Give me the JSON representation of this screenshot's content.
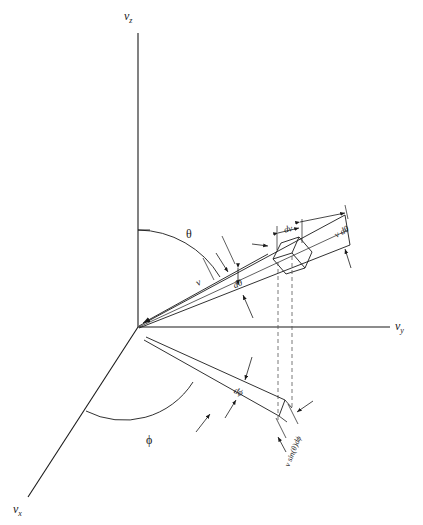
{
  "figure": {
    "axes": {
      "vz": {
        "label": "v",
        "sub": "z"
      },
      "vy": {
        "label": "v",
        "sub": "y"
      },
      "vx": {
        "label": "v",
        "sub": "x"
      }
    },
    "angles": {
      "theta": "θ",
      "phi": "ϕ"
    },
    "dimensions": {
      "speed": "v",
      "dv": "dv",
      "dtheta": "dθ",
      "v_dtheta": "v dθ",
      "dphi": "dϕ",
      "v_sin_theta_dphi": "v sin(θ)dϕ"
    },
    "colors": {
      "line": "#1a1a1a",
      "background": "#ffffff",
      "dashed": "#555555"
    }
  }
}
